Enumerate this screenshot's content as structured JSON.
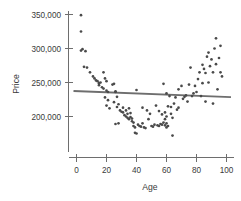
{
  "chart_data": {
    "type": "scatter",
    "title": "",
    "xlabel": "Age",
    "ylabel": "Price",
    "grid": false,
    "legend": null,
    "xlim": [
      -3,
      103
    ],
    "ylim": [
      165000,
      357000
    ],
    "xticks": [
      0,
      20,
      40,
      60,
      80,
      100
    ],
    "xticklabels": [
      "0",
      "20",
      "40",
      "60",
      "80",
      "100"
    ],
    "yticks": [
      200000,
      250000,
      300000,
      350000
    ],
    "yticklabels": [
      "200,000",
      "250,000",
      "300,000",
      "350,000"
    ],
    "point_color": "#4a4a4a",
    "line_color": "#6e6e6e",
    "axis_color": "#6e6e6e",
    "annotation": "U-shaped scatter of Price versus Age with a nearly flat least-squares line overlaid",
    "series": [
      {
        "name": "Price vs Age",
        "marker": "dot",
        "points": [
          [
            3,
            349000
          ],
          [
            3,
            325000
          ],
          [
            3,
            297000
          ],
          [
            4,
            299000
          ],
          [
            6,
            296000
          ],
          [
            5,
            273000
          ],
          [
            7,
            272000
          ],
          [
            9,
            265000
          ],
          [
            11,
            259000
          ],
          [
            12,
            256000
          ],
          [
            13,
            253000
          ],
          [
            14,
            252000
          ],
          [
            15,
            249000
          ],
          [
            16,
            250000
          ],
          [
            15,
            246000
          ],
          [
            17,
            243000
          ],
          [
            18,
            241000
          ],
          [
            18,
            265000
          ],
          [
            19,
            256000
          ],
          [
            20,
            252000
          ],
          [
            20,
            238000
          ],
          [
            21,
            236000
          ],
          [
            19,
            228000
          ],
          [
            21,
            224000
          ],
          [
            20,
            216000
          ],
          [
            22,
            212000
          ],
          [
            24,
            247000
          ],
          [
            25,
            248000
          ],
          [
            26,
            237000
          ],
          [
            26,
            236000
          ],
          [
            27,
            229000
          ],
          [
            25,
            221000
          ],
          [
            28,
            218000
          ],
          [
            27,
            214000
          ],
          [
            26,
            189000
          ],
          [
            28,
            190000
          ],
          [
            29,
            209000
          ],
          [
            30,
            207000
          ],
          [
            31,
            206000
          ],
          [
            31,
            213000
          ],
          [
            32,
            202000
          ],
          [
            33,
            209000
          ],
          [
            33,
            200000
          ],
          [
            34,
            204000
          ],
          [
            34,
            198000
          ],
          [
            35,
            196000
          ],
          [
            35,
            212000
          ],
          [
            36,
            205000
          ],
          [
            36,
            199000
          ],
          [
            37,
            197000
          ],
          [
            37,
            193000
          ],
          [
            38,
            191000
          ],
          [
            38,
            186000
          ],
          [
            39,
            184000
          ],
          [
            39,
            176000
          ],
          [
            40,
            175000
          ],
          [
            40,
            239000
          ],
          [
            41,
            188000
          ],
          [
            42,
            186000
          ],
          [
            43,
            185000
          ],
          [
            44,
            190000
          ],
          [
            44,
            213000
          ],
          [
            45,
            184000
          ],
          [
            46,
            183000
          ],
          [
            47,
            209000
          ],
          [
            48,
            196000
          ],
          [
            49,
            204000
          ],
          [
            50,
            186000
          ],
          [
            51,
            185000
          ],
          [
            52,
            188000
          ],
          [
            53,
            216000
          ],
          [
            54,
            187000
          ],
          [
            55,
            186000
          ],
          [
            55,
            208000
          ],
          [
            56,
            189000
          ],
          [
            57,
            203000
          ],
          [
            57,
            188000
          ],
          [
            58,
            191000
          ],
          [
            58,
            248000
          ],
          [
            59,
            206000
          ],
          [
            59,
            196000
          ],
          [
            59,
            187000
          ],
          [
            60,
            200000
          ],
          [
            60,
            190000
          ],
          [
            60,
            184000
          ],
          [
            60,
            234000
          ],
          [
            61,
            186000
          ],
          [
            61,
            215000
          ],
          [
            62,
            230000
          ],
          [
            63,
            214000
          ],
          [
            63,
            204000
          ],
          [
            64,
            172000
          ],
          [
            64,
            198000
          ],
          [
            65,
            219000
          ],
          [
            66,
            228000
          ],
          [
            67,
            210000
          ],
          [
            68,
            240000
          ],
          [
            68,
            213000
          ],
          [
            70,
            245000
          ],
          [
            71,
            226000
          ],
          [
            72,
            229000
          ],
          [
            73,
            231000
          ],
          [
            74,
            222000
          ],
          [
            75,
            247000
          ],
          [
            76,
            272000
          ],
          [
            77,
            230000
          ],
          [
            78,
            234000
          ],
          [
            79,
            245000
          ],
          [
            80,
            236000
          ],
          [
            81,
            255000
          ],
          [
            82,
            265000
          ],
          [
            83,
            230000
          ],
          [
            84,
            249000
          ],
          [
            84,
            276000
          ],
          [
            85,
            270000
          ],
          [
            86,
            222000
          ],
          [
            86,
            264000
          ],
          [
            87,
            288000
          ],
          [
            88,
            250000
          ],
          [
            88,
            294000
          ],
          [
            89,
            274000
          ],
          [
            90,
            284000
          ],
          [
            91,
            219000
          ],
          [
            91,
            265000
          ],
          [
            92,
            300000
          ],
          [
            93,
            315000
          ],
          [
            93,
            277000
          ],
          [
            94,
            240000
          ],
          [
            95,
            286000
          ],
          [
            96,
            304000
          ],
          [
            96,
            265000
          ],
          [
            97,
            259000
          ]
        ]
      }
    ],
    "fit_line": {
      "name": "least-squares regression line",
      "x_start": -2,
      "y_start": 237500,
      "x_end": 103,
      "y_end": 228500
    }
  }
}
